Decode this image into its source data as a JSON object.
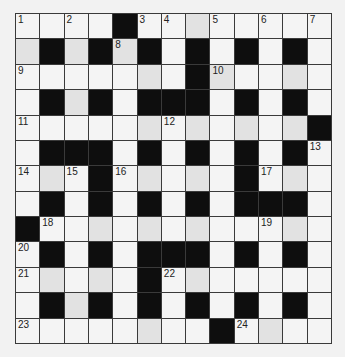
{
  "puzzle": {
    "type": "crossword",
    "rows": 13,
    "cols": 13,
    "layout": [
      "....#........",
      ".#.#.#.#.#.#.",
      ".......#.....",
      ".#.#.###.#.#.",
      "............#",
      ".###.#.#.#.#.",
      "...#.....#...",
      ".#.#.#.#.###.",
      "#............",
      ".#.#.###.#.#.",
      ".....#.......",
      ".#.#.#.#.#.#.",
      "........#...."
    ],
    "shaded": [
      "r0c7",
      "r1c0",
      "r1c2",
      "r1c4",
      "r2c5",
      "r2c8",
      "r2c11",
      "r3c2",
      "r4c5",
      "r4c7",
      "r4c9",
      "r4c11",
      "r6c1",
      "r6c5",
      "r6c7",
      "r6c11",
      "r8c3",
      "r8c5",
      "r8c7",
      "r8c11",
      "r10c1",
      "r10c3",
      "r10c7",
      "r11c2",
      "r12c5",
      "r12c10"
    ],
    "numbers": [
      {
        "r": 0,
        "c": 0,
        "n": "1"
      },
      {
        "r": 0,
        "c": 2,
        "n": "2"
      },
      {
        "r": 0,
        "c": 5,
        "n": "3"
      },
      {
        "r": 0,
        "c": 6,
        "n": "4"
      },
      {
        "r": 0,
        "c": 8,
        "n": "5"
      },
      {
        "r": 0,
        "c": 10,
        "n": "6"
      },
      {
        "r": 0,
        "c": 12,
        "n": "7"
      },
      {
        "r": 1,
        "c": 4,
        "n": "8"
      },
      {
        "r": 2,
        "c": 0,
        "n": "9"
      },
      {
        "r": 2,
        "c": 8,
        "n": "10"
      },
      {
        "r": 4,
        "c": 0,
        "n": "11"
      },
      {
        "r": 4,
        "c": 6,
        "n": "12"
      },
      {
        "r": 5,
        "c": 12,
        "n": "13"
      },
      {
        "r": 6,
        "c": 0,
        "n": "14"
      },
      {
        "r": 6,
        "c": 2,
        "n": "15"
      },
      {
        "r": 6,
        "c": 4,
        "n": "16"
      },
      {
        "r": 6,
        "c": 10,
        "n": "17"
      },
      {
        "r": 8,
        "c": 1,
        "n": "18"
      },
      {
        "r": 8,
        "c": 10,
        "n": "19"
      },
      {
        "r": 9,
        "c": 0,
        "n": "20"
      },
      {
        "r": 10,
        "c": 0,
        "n": "21"
      },
      {
        "r": 10,
        "c": 6,
        "n": "22"
      },
      {
        "r": 12,
        "c": 0,
        "n": "23"
      },
      {
        "r": 12,
        "c": 9,
        "n": "24"
      }
    ]
  },
  "colors": {
    "black_cell": "#0e0e0e",
    "white_cell": "#f4f4f4",
    "grid_line": "#3a3a3a"
  }
}
